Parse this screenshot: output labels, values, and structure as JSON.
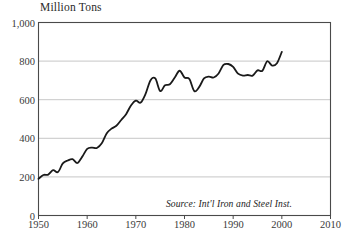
{
  "figure": {
    "unit_title": "Million Tons",
    "source_note": "Source: Int'l Iron and Steel Inst.",
    "source_x": 229,
    "source_y": 198
  },
  "chart_data": {
    "type": "line",
    "title": "Million Tons",
    "subtitle": "",
    "xlabel": "",
    "ylabel": "Million Tons",
    "annotations": [
      "Source: Int'l Iron and Steel Inst."
    ],
    "legend": [],
    "legend_position": "none",
    "grid": true,
    "grid_axis": "y",
    "xlim": [
      1950,
      2010
    ],
    "ylim": [
      0,
      1000
    ],
    "xticks": [
      1950,
      1960,
      1970,
      1980,
      1990,
      2000,
      2010
    ],
    "xtick_labels": [
      "1950",
      "1960",
      "1970",
      "1980",
      "1990",
      "2000",
      "2010"
    ],
    "yticks": [
      0,
      200,
      400,
      600,
      800,
      1000
    ],
    "ytick_labels": [
      "0",
      "200",
      "400",
      "600",
      "800",
      "1,000"
    ],
    "line_color": "#1a1a1a",
    "line_width": 1.8,
    "series": [
      {
        "name": "World steel production",
        "x": [
          1950,
          1951,
          1952,
          1953,
          1954,
          1955,
          1956,
          1957,
          1958,
          1959,
          1960,
          1961,
          1962,
          1963,
          1964,
          1965,
          1966,
          1967,
          1968,
          1969,
          1970,
          1971,
          1972,
          1973,
          1974,
          1975,
          1976,
          1977,
          1978,
          1979,
          1980,
          1981,
          1982,
          1983,
          1984,
          1985,
          1986,
          1987,
          1988,
          1989,
          1990,
          1991,
          1992,
          1993,
          1994,
          1995,
          1996,
          1997,
          1998,
          1999,
          2000
        ],
        "values": [
          190,
          210,
          212,
          235,
          225,
          270,
          285,
          292,
          272,
          305,
          345,
          352,
          350,
          374,
          425,
          450,
          465,
          495,
          525,
          570,
          595,
          585,
          630,
          700,
          710,
          645,
          675,
          680,
          715,
          750,
          715,
          707,
          645,
          665,
          710,
          720,
          715,
          736,
          780,
          785,
          770,
          735,
          725,
          728,
          725,
          752,
          750,
          799,
          777,
          789,
          848
        ]
      }
    ]
  }
}
